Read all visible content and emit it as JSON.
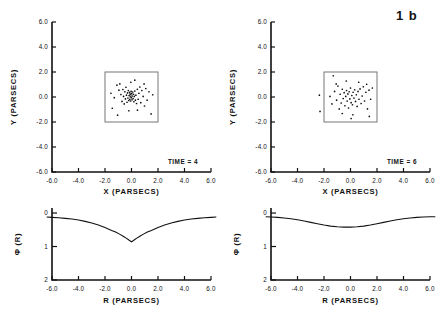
{
  "figure": {
    "label": "1 b"
  },
  "chart_data": [
    {
      "type": "scatter",
      "id": "xy-time-4",
      "title": "",
      "xlabel": "X  (PARSECS)",
      "ylabel": "Y  (PARSECS)",
      "annotation": "TIME = 4",
      "xlim": [
        -6.0,
        6.0
      ],
      "ylim": [
        -6.0,
        6.0
      ],
      "xticks": [
        -6.0,
        -4.0,
        -2.0,
        0.0,
        2.0,
        4.0,
        6.0
      ],
      "yticks": [
        -6.0,
        -4.0,
        -2.0,
        0.0,
        2.0,
        4.0,
        6.0
      ],
      "xticklabels": [
        "-6.0",
        "-4.0",
        "-2.0",
        "0.0",
        "2.0",
        "4.0",
        "6.0"
      ],
      "yticklabels": [
        "-6.0",
        "-4.0",
        "-2.0",
        "0.0",
        "2.0",
        "4.0",
        "6.0"
      ],
      "grid": false,
      "inset_box": {
        "x0": -2.0,
        "x1": 2.0,
        "y0": -2.0,
        "y1": 2.0
      },
      "points": [
        [
          -1.55,
          0.3
        ],
        [
          -1.3,
          -0.05
        ],
        [
          -1.1,
          0.95
        ],
        [
          -0.95,
          0.55
        ],
        [
          -0.88,
          1.05
        ],
        [
          -0.8,
          0.2
        ],
        [
          -0.72,
          -0.35
        ],
        [
          -0.65,
          0.6
        ],
        [
          -0.6,
          0.05
        ],
        [
          -0.55,
          -0.55
        ],
        [
          -0.5,
          0.42
        ],
        [
          -0.46,
          -0.15
        ],
        [
          -0.42,
          0.78
        ],
        [
          -0.38,
          0.15
        ],
        [
          -0.34,
          -0.42
        ],
        [
          -0.3,
          0.33
        ],
        [
          -0.27,
          -0.08
        ],
        [
          -0.24,
          0.52
        ],
        [
          -0.21,
          -0.28
        ],
        [
          -0.18,
          0.12
        ],
        [
          -0.15,
          0.38
        ],
        [
          -0.13,
          -0.18
        ],
        [
          -0.11,
          0.25
        ],
        [
          -0.09,
          0.02
        ],
        [
          -0.07,
          -0.32
        ],
        [
          -0.05,
          0.18
        ],
        [
          -0.03,
          0.45
        ],
        [
          -0.01,
          -0.05
        ],
        [
          0.02,
          0.28
        ],
        [
          0.04,
          -0.22
        ],
        [
          0.06,
          0.08
        ],
        [
          0.09,
          0.4
        ],
        [
          0.12,
          -0.12
        ],
        [
          0.15,
          0.22
        ],
        [
          0.18,
          -0.38
        ],
        [
          0.21,
          0.05
        ],
        [
          0.25,
          0.48
        ],
        [
          0.29,
          -0.25
        ],
        [
          0.33,
          0.15
        ],
        [
          0.38,
          -0.52
        ],
        [
          0.44,
          0.62
        ],
        [
          0.5,
          -0.18
        ],
        [
          0.56,
          0.3
        ],
        [
          0.63,
          0.8
        ],
        [
          0.7,
          -0.45
        ],
        [
          0.78,
          0.52
        ],
        [
          0.88,
          0.05
        ],
        [
          0.98,
          -0.72
        ],
        [
          1.08,
          0.68
        ],
        [
          1.18,
          -0.25
        ],
        [
          1.32,
          0.42
        ],
        [
          1.48,
          -1.35
        ],
        [
          -1.45,
          -0.9
        ],
        [
          -0.2,
          -1.1
        ],
        [
          0.25,
          1.35
        ],
        [
          -0.05,
          1.18
        ],
        [
          0.95,
          1.05
        ],
        [
          -1.05,
          -1.45
        ],
        [
          0.45,
          -1.05
        ],
        [
          1.6,
          0.18
        ]
      ]
    },
    {
      "type": "scatter",
      "id": "xy-time-6",
      "title": "",
      "xlabel": "X  (PARSECS)",
      "ylabel": "Y  (PARSECS)",
      "annotation": "TIME = 6",
      "xlim": [
        -6.0,
        6.0
      ],
      "ylim": [
        -6.0,
        6.0
      ],
      "xticks": [
        -6.0,
        -4.0,
        -2.0,
        0.0,
        2.0,
        4.0,
        6.0
      ],
      "yticks": [
        -6.0,
        -4.0,
        -2.0,
        0.0,
        2.0,
        4.0,
        6.0
      ],
      "xticklabels": [
        "-6.0",
        "-4.0",
        "-2.0",
        "0.0",
        "2.0",
        "4.0",
        "6.0"
      ],
      "yticklabels": [
        "-6.0",
        "-4.0",
        "-2.0",
        "0.0",
        "2.0",
        "4.0",
        "6.0"
      ],
      "grid": false,
      "inset_box": {
        "x0": -2.0,
        "x1": 2.0,
        "y0": -2.0,
        "y1": 2.0
      },
      "points": [
        [
          -2.35,
          0.15
        ],
        [
          -2.3,
          -1.15
        ],
        [
          -1.3,
          1.7
        ],
        [
          -1.55,
          0.05
        ],
        [
          -1.4,
          -0.55
        ],
        [
          -1.2,
          0.45
        ],
        [
          -1.05,
          -0.25
        ],
        [
          -0.95,
          0.88
        ],
        [
          -0.85,
          -0.95
        ],
        [
          -0.78,
          0.22
        ],
        [
          -0.7,
          -0.48
        ],
        [
          -0.62,
          0.62
        ],
        [
          -0.55,
          -0.12
        ],
        [
          -0.48,
          0.35
        ],
        [
          -0.42,
          -0.7
        ],
        [
          -0.36,
          0.05
        ],
        [
          -0.3,
          0.52
        ],
        [
          -0.25,
          -0.32
        ],
        [
          -0.2,
          0.25
        ],
        [
          -0.15,
          -0.88
        ],
        [
          -0.1,
          0.42
        ],
        [
          -0.05,
          -0.15
        ],
        [
          0.0,
          0.72
        ],
        [
          0.05,
          -0.45
        ],
        [
          0.1,
          0.12
        ],
        [
          0.15,
          -0.62
        ],
        [
          0.2,
          0.38
        ],
        [
          0.26,
          -0.08
        ],
        [
          0.32,
          0.58
        ],
        [
          0.38,
          -0.35
        ],
        [
          0.44,
          0.18
        ],
        [
          0.5,
          -0.75
        ],
        [
          0.57,
          0.45
        ],
        [
          0.64,
          -0.18
        ],
        [
          0.72,
          0.65
        ],
        [
          0.8,
          -0.52
        ],
        [
          0.88,
          0.08
        ],
        [
          0.97,
          0.82
        ],
        [
          1.06,
          -0.32
        ],
        [
          1.16,
          0.38
        ],
        [
          1.28,
          -0.95
        ],
        [
          1.4,
          0.55
        ],
        [
          1.52,
          -0.18
        ],
        [
          1.65,
          0.72
        ],
        [
          1.42,
          -1.55
        ],
        [
          -0.62,
          -1.32
        ],
        [
          0.18,
          -1.42
        ],
        [
          0.62,
          1.18
        ],
        [
          -1.08,
          1.05
        ],
        [
          1.22,
          1.02
        ],
        [
          -0.32,
          1.28
        ],
        [
          0.05,
          -1.72
        ]
      ]
    },
    {
      "type": "line",
      "id": "potential-time-4",
      "title": "",
      "xlabel": "R  (PARSECS)",
      "ylabel": "Φ (R)",
      "xlim": [
        -6.0,
        6.0
      ],
      "ylim": [
        2.0,
        -0.15
      ],
      "y_axis_inverted": true,
      "xticks": [
        -6.0,
        -4.0,
        -2.0,
        0.0,
        2.0,
        4.0,
        6.0
      ],
      "yticks": [
        0,
        1,
        2
      ],
      "xticklabels": [
        "-6.0",
        "-4.0",
        "-2.0",
        "0.0",
        "2.0",
        "4.0",
        "6.0"
      ],
      "yticklabels": [
        "0",
        "1",
        "2"
      ],
      "grid": false,
      "x": [
        -6.4,
        -6.0,
        -5.5,
        -5.0,
        -4.5,
        -4.0,
        -3.5,
        -3.0,
        -2.5,
        -2.0,
        -1.5,
        -1.2,
        -0.9,
        -0.6,
        -0.4,
        -0.25,
        -0.12,
        0.0,
        0.12,
        0.25,
        0.4,
        0.6,
        0.9,
        1.2,
        1.5,
        2.0,
        2.5,
        3.0,
        3.5,
        4.0,
        4.5,
        5.0,
        5.5,
        6.0,
        6.4
      ],
      "y": [
        0.12,
        0.13,
        0.14,
        0.16,
        0.18,
        0.21,
        0.25,
        0.3,
        0.36,
        0.43,
        0.52,
        0.57,
        0.63,
        0.7,
        0.75,
        0.79,
        0.83,
        0.86,
        0.83,
        0.79,
        0.75,
        0.7,
        0.63,
        0.57,
        0.52,
        0.43,
        0.36,
        0.3,
        0.25,
        0.21,
        0.18,
        0.16,
        0.14,
        0.13,
        0.12
      ]
    },
    {
      "type": "line",
      "id": "potential-time-6",
      "title": "",
      "xlabel": "R  (PARSECS)",
      "ylabel": "Φ (R)",
      "xlim": [
        -6.0,
        6.0
      ],
      "ylim": [
        2.0,
        -0.15
      ],
      "y_axis_inverted": true,
      "xticks": [
        -6.0,
        -4.0,
        -2.0,
        0.0,
        2.0,
        4.0,
        6.0
      ],
      "yticks": [
        0,
        1,
        2
      ],
      "xticklabels": [
        "-6.0",
        "-4.0",
        "-2.0",
        "0.0",
        "2.0",
        "4.0",
        "6.0"
      ],
      "yticklabels": [
        "0",
        "1",
        "2"
      ],
      "grid": false,
      "x": [
        -6.4,
        -6.0,
        -5.5,
        -5.0,
        -4.5,
        -4.0,
        -3.5,
        -3.0,
        -2.5,
        -2.0,
        -1.5,
        -1.0,
        -0.5,
        0.0,
        0.5,
        1.0,
        1.5,
        2.0,
        2.5,
        3.0,
        3.5,
        4.0,
        4.5,
        5.0,
        5.5,
        6.0,
        6.4
      ],
      "y": [
        0.11,
        0.12,
        0.13,
        0.15,
        0.17,
        0.2,
        0.24,
        0.28,
        0.32,
        0.36,
        0.39,
        0.41,
        0.42,
        0.42,
        0.41,
        0.39,
        0.36,
        0.32,
        0.28,
        0.24,
        0.2,
        0.17,
        0.15,
        0.13,
        0.12,
        0.11,
        0.11
      ]
    }
  ]
}
